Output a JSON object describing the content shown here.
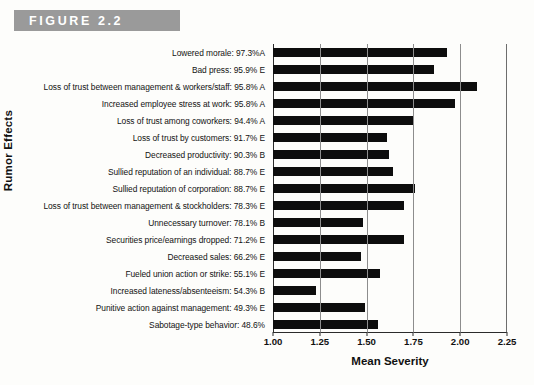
{
  "figure": {
    "band_label": "FIGURE 2.2"
  },
  "chart_data": {
    "type": "bar",
    "orientation": "horizontal",
    "title": "FIGURE 2.2",
    "xlabel": "Mean Severity",
    "ylabel": "Rumor Effects",
    "xlim": [
      1.0,
      2.25
    ],
    "xticks": [
      "1.00",
      "1.25",
      "1.50",
      "1.75",
      "2.00",
      "2.25"
    ],
    "xtick_values": [
      1.0,
      1.25,
      1.5,
      1.75,
      2.0,
      2.25
    ],
    "grid": true,
    "grid_axis": "x",
    "legend": null,
    "bar_color": "#0d0d0d",
    "categories": [
      "Lowered morale: 97.3%A",
      "Bad press: 95.9% E",
      "Loss of trust between management & workers/staff: 95.8% A",
      "Increased employee stress at work: 95.8% A",
      "Loss of trust among coworkers: 94.4% A",
      "Loss of trust by customers: 91.7% E",
      "Decreased productivity: 90.3% B",
      "Sullied reputation of an individual: 88.7% E",
      "Sullied reputation of corporation: 88.7% E",
      "Loss of trust between management & stockholders: 78.3% E",
      "Unnecessary turnover: 78.1% B",
      "Securities price/earnings dropped: 71.2% E",
      "Decreased sales: 66.2% E",
      "Fueled union action or strike: 55.1% E",
      "Increased lateness/absenteeism: 54.3% B",
      "Punitive action against management: 49.3% E",
      "Sabotage-type behavior: 48.6%"
    ],
    "values": [
      1.93,
      1.86,
      2.09,
      1.97,
      1.75,
      1.61,
      1.62,
      1.64,
      1.76,
      1.7,
      1.48,
      1.7,
      1.47,
      1.57,
      1.23,
      1.49,
      1.56
    ]
  }
}
